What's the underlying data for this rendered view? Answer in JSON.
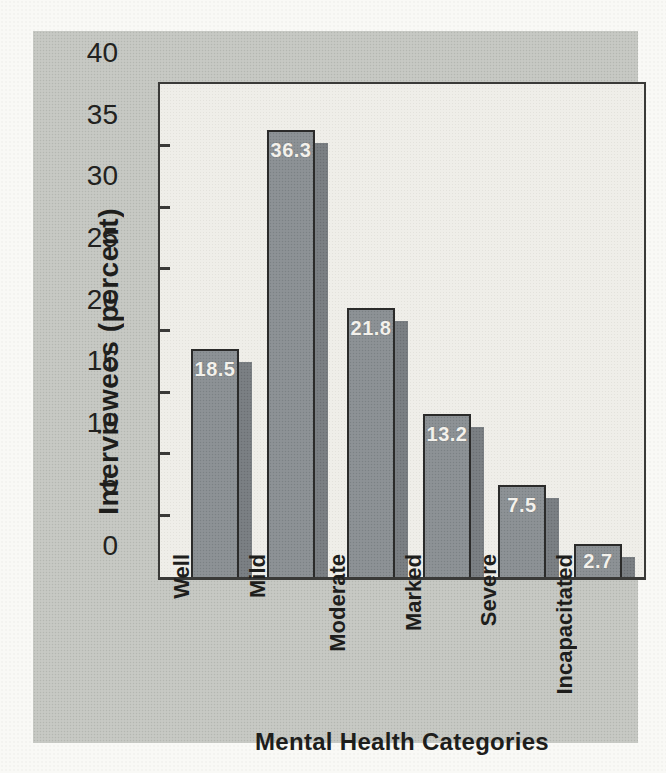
{
  "figure": {
    "page_background": "#f9f9f6",
    "panel_color": "#c7c9c4",
    "plot_background": "#efeee9",
    "ink_color": "#222220",
    "bar_color": "#8d9296",
    "bar_shadow_color": "#7b8084",
    "bar_value_text_color": "#f3f1ec"
  },
  "chart_data": {
    "type": "bar",
    "title": "",
    "categories": [
      "Well",
      "Mild",
      "Moderate",
      "Marked",
      "Severe",
      "Incapacitated"
    ],
    "values": [
      18.5,
      36.3,
      21.8,
      13.2,
      7.5,
      2.7
    ],
    "bar_value_labels": [
      "18.5",
      "36.3",
      "21.8",
      "13.2",
      "7.5",
      "2.7"
    ],
    "xlabel": "Mental Health Categories",
    "ylabel": "Interviewees (percent)",
    "ylim": [
      0,
      40
    ],
    "yticks": [
      0,
      5,
      10,
      15,
      20,
      25,
      30,
      35,
      40
    ],
    "grid": false,
    "legend": "none",
    "style_hint": "3D offset-shadow bars, x tick labels rotated 90deg CCW, inward y ticks, scanned textbook figure"
  }
}
